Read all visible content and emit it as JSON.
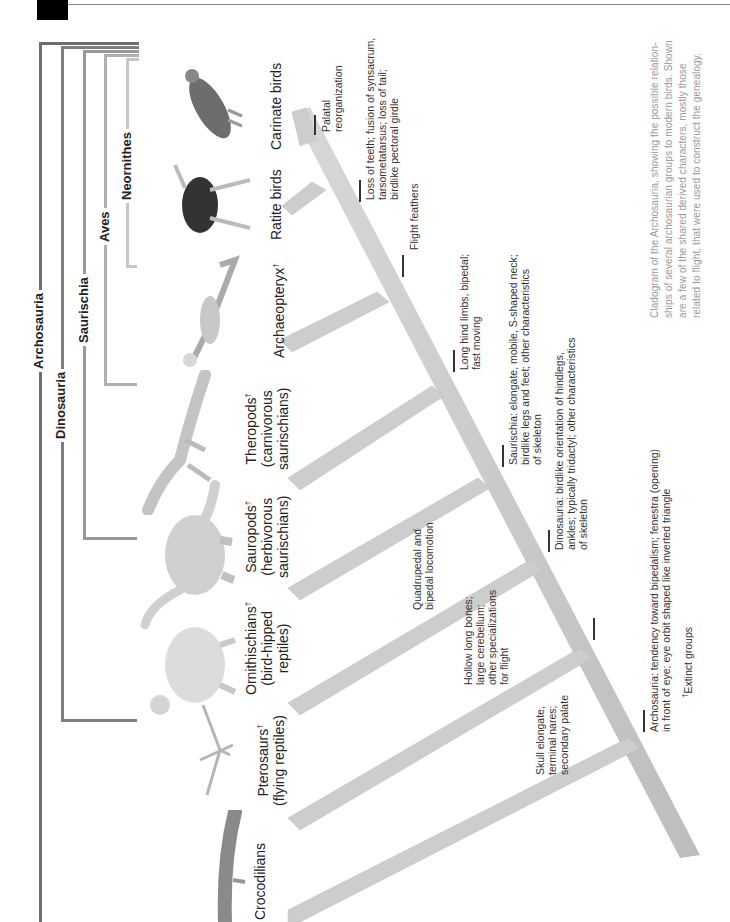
{
  "figure": {
    "orientation": "rotated-90-ccw",
    "clades": [
      {
        "name": "Archosauria",
        "color": "#6e6e6e"
      },
      {
        "name": "Dinosauria",
        "color": "#7e7e7e"
      },
      {
        "name": "Saurischia",
        "color": "#999999"
      },
      {
        "name": "Aves",
        "color": "#b0b0b0"
      },
      {
        "name": "Neornithes",
        "color": "#c6c6c6"
      }
    ],
    "taxa": [
      {
        "name": "Crocodilians",
        "sub": "",
        "extinct": false,
        "icon": "crocodile-icon"
      },
      {
        "name": "Pterosaurs",
        "sub": "(flying reptiles)",
        "extinct": true,
        "icon": "pterosaur-icon"
      },
      {
        "name": "Ornithischians",
        "sub": "(bird-hipped reptiles)",
        "sub1": "(bird-hipped",
        "sub2": "reptiles)",
        "extinct": true,
        "icon": "ornithischian-icon"
      },
      {
        "name": "Sauropods",
        "sub1": "(herbivorous",
        "sub2": "saurischians)",
        "extinct": true,
        "icon": "sauropod-icon"
      },
      {
        "name": "Theropods",
        "sub1": "(carnivorous",
        "sub2": "saurischians)",
        "extinct": true,
        "icon": "theropod-icon"
      },
      {
        "name": "Archaeopteryx",
        "extinct": true,
        "icon": "archaeopteryx-icon"
      },
      {
        "name": "Ratite birds",
        "extinct": false,
        "icon": "ostrich-icon"
      },
      {
        "name": "Carinate birds",
        "extinct": false,
        "icon": "eagle-icon"
      }
    ],
    "dagger": "†",
    "characters": [
      {
        "id": "palatal",
        "lines": [
          "Palatal",
          "reorganization"
        ]
      },
      {
        "id": "loss-teeth",
        "lines": [
          "Loss of teeth; fusion of synsacrum,",
          "tarsometatarsus; loss of tail;",
          "birdlike pectoral girdle"
        ]
      },
      {
        "id": "flight-feathers",
        "lines": [
          "Flight feathers"
        ]
      },
      {
        "id": "long-hind",
        "lines": [
          "Long hind limbs, bipedal;",
          "fast moving"
        ]
      },
      {
        "id": "saurischia",
        "lines": [
          "Saurischia: elongate, mobile, S-shaped neck;",
          "birdlike legs and feet; other characteristics",
          "of skeleton"
        ]
      },
      {
        "id": "dinosauria",
        "lines": [
          "Dinosauria: birdlike orientation of hindlegs,",
          "ankles; typically tridactyl; other characteristics",
          "of skeleton"
        ]
      },
      {
        "id": "quadrupedal",
        "lines": [
          "Quadrupedal and",
          "bipedal locomotion"
        ]
      },
      {
        "id": "hollow-bones",
        "lines": [
          "Hollow long bones;",
          "large cerebellum;",
          "other specializations",
          "for flight"
        ]
      },
      {
        "id": "archosauria",
        "lines": [
          "Archosauria: tendency toward bipedalism; fenestra (opening)",
          "in front of eye; eye orbit shaped like inverted triangle"
        ]
      },
      {
        "id": "skull",
        "lines": [
          "Skull elongate,",
          "terminal nares;",
          "secondary palate"
        ]
      }
    ],
    "legend": {
      "dagger": "†",
      "text": "Extinct groups"
    },
    "caption": {
      "lines": [
        "Cladogram of the Archosauria, showing the possible relation-",
        "ships of several archosaurian groups to modern birds. Shown",
        "are a few of the shared derived characters, mostly those",
        "related to flight, that were used to construct the genealogy."
      ]
    },
    "colors": {
      "trunk": "#cfcfcf",
      "trunk_shadow": "#b8b8b8",
      "tab": "#000000",
      "rule": "#888888",
      "caption": "#999999"
    }
  }
}
